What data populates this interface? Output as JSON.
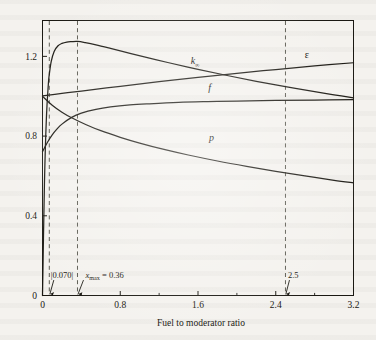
{
  "figure": {
    "background_color": "#f4f2ee",
    "ink_color": "#1a1812"
  },
  "chart_data": {
    "type": "line",
    "title": "",
    "subtitle": "",
    "xlabel": "Fuel to moderator ratio",
    "ylabel": "",
    "xlim": [
      0,
      3.2
    ],
    "ylim": [
      0,
      1.38
    ],
    "grid": false,
    "legend_position": "inline-curve-labels",
    "xticks": [
      0,
      0.8,
      1.6,
      2.4,
      3.2
    ],
    "xticklabels": [
      "0",
      "0.8",
      "1.6",
      "2.4",
      "3.2"
    ],
    "xminorticks": [
      0.4,
      1.2,
      2.0,
      2.8
    ],
    "yticks": [
      0,
      0.4,
      0.8,
      1.2
    ],
    "yticklabels": [
      "0",
      "0.4",
      "0.8",
      "1.2"
    ],
    "series": [
      {
        "name": "k_inf",
        "label": "k",
        "label_sub": "∞",
        "label_x": 1.57,
        "label_y": 1.16,
        "description": "infinite multiplication factor, product of epsilon, p and f; rises steeply from 0, peaks near x = 0.36 then falls",
        "x": [
          0.0,
          0.02,
          0.04,
          0.06,
          0.07,
          0.09,
          0.12,
          0.16,
          0.2,
          0.25,
          0.3,
          0.36,
          0.44,
          0.55,
          0.7,
          0.9,
          1.1,
          1.3,
          1.6,
          1.9,
          2.2,
          2.5,
          2.8,
          3.0,
          3.2
        ],
        "y": [
          0.0,
          0.56,
          0.89,
          1.06,
          1.11,
          1.175,
          1.225,
          1.253,
          1.265,
          1.272,
          1.274,
          1.275,
          1.269,
          1.258,
          1.24,
          1.215,
          1.191,
          1.168,
          1.135,
          1.104,
          1.075,
          1.048,
          1.023,
          1.007,
          0.992
        ]
      },
      {
        "name": "epsilon",
        "label": "ε",
        "label_x": 2.72,
        "label_y": 1.19,
        "description": "fast fission factor; starts at 1.0 and rises slowly and almost linearly",
        "x": [
          0.0,
          0.2,
          0.4,
          0.8,
          1.2,
          1.6,
          2.0,
          2.4,
          2.8,
          3.2
        ],
        "y": [
          1.002,
          1.014,
          1.026,
          1.05,
          1.073,
          1.095,
          1.115,
          1.134,
          1.152,
          1.168
        ]
      },
      {
        "name": "f",
        "label": "f",
        "label_x": 1.72,
        "label_y": 1.025,
        "description": "thermal utilization factor; rises steeply from about 0.72 at x=0 and saturates toward 0.98",
        "x": [
          0.0,
          0.05,
          0.1,
          0.15,
          0.2,
          0.3,
          0.4,
          0.55,
          0.7,
          0.9,
          1.1,
          1.4,
          1.7,
          2.0,
          2.4,
          2.8,
          3.2
        ],
        "y": [
          0.722,
          0.768,
          0.806,
          0.836,
          0.86,
          0.894,
          0.915,
          0.934,
          0.946,
          0.956,
          0.962,
          0.969,
          0.973,
          0.976,
          0.979,
          0.981,
          0.983
        ]
      },
      {
        "name": "p",
        "label": "p",
        "label_x": 1.74,
        "label_y": 0.775,
        "description": "resonance escape probability; starts at 1.0 and decreases monotonically",
        "x": [
          0.0,
          0.1,
          0.2,
          0.3,
          0.45,
          0.6,
          0.8,
          1.0,
          1.25,
          1.5,
          1.8,
          2.1,
          2.4,
          2.7,
          3.0,
          3.2
        ],
        "y": [
          1.0,
          0.955,
          0.92,
          0.892,
          0.857,
          0.827,
          0.794,
          0.765,
          0.733,
          0.705,
          0.675,
          0.648,
          0.623,
          0.6,
          0.578,
          0.565
        ]
      }
    ],
    "vertical_markers": [
      {
        "name": "x-0070",
        "x": 0.07,
        "label": "0.070",
        "label_has_bars": true
      },
      {
        "name": "x-max",
        "x": 0.36,
        "label": "= 0.36",
        "label_prefix": "x",
        "label_prefix_sub": "max"
      },
      {
        "name": "x-25",
        "x": 2.5,
        "label": "2.5"
      }
    ],
    "annotations": [
      {
        "name": "ann-0070",
        "text": "|0.070|",
        "x": 0.07,
        "y": 0.09
      },
      {
        "name": "ann-xmax",
        "text": "x_max = 0.36",
        "x": 0.36,
        "y": 0.09
      },
      {
        "name": "ann-25",
        "text": "2.5",
        "x": 2.5,
        "y": 0.09
      }
    ]
  }
}
